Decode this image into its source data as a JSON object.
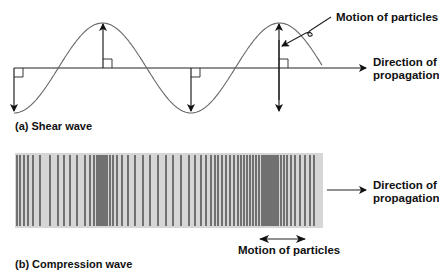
{
  "shear": {
    "caption": "(a)  Shear wave",
    "motion_label": "Motion of particles",
    "direction_label_line1": "Direction of",
    "direction_label_line2": "propagation",
    "axis": {
      "x_start": 14,
      "x_end": 366,
      "y": 68
    },
    "wave": {
      "x_start": 14,
      "x_end": 322,
      "amplitude": 45,
      "wavelength": 177,
      "peaks_x": [
        103,
        279
      ],
      "troughs_x": [
        14,
        191
      ]
    },
    "displacement_arrows": [
      {
        "x": 14,
        "dir": "down"
      },
      {
        "x": 103,
        "dir": "up"
      },
      {
        "x": 191,
        "dir": "down"
      },
      {
        "x": 279,
        "dir": "both"
      }
    ]
  },
  "compression": {
    "caption": "(b)  Compression wave",
    "motion_label": "Motion of particles",
    "direction_label_line1": "Direction of",
    "direction_label_line2": "propagation",
    "band": {
      "x": 15,
      "y": 153,
      "width": 308,
      "height": 75,
      "fill": "#d6d6d6"
    },
    "line_color": "#3a3a3a",
    "lines_x": [
      17,
      20,
      24,
      28,
      33,
      40,
      50,
      58,
      64,
      70,
      77,
      85,
      90,
      94,
      97,
      99,
      101,
      103,
      105,
      107,
      110,
      113,
      117,
      122,
      128,
      135,
      143,
      150,
      158,
      166,
      173,
      181,
      189,
      195,
      201,
      206,
      211,
      215,
      218,
      222,
      226,
      230,
      234,
      238,
      241,
      244,
      247,
      250,
      253,
      256,
      259,
      262,
      264,
      266,
      268,
      270,
      272,
      274,
      276,
      278,
      281,
      284,
      287,
      291,
      295,
      300,
      305,
      310,
      314
    ]
  },
  "colors": {
    "ink": "#222222",
    "band": "#d6d6d6",
    "bar": "#3a3a3a"
  }
}
